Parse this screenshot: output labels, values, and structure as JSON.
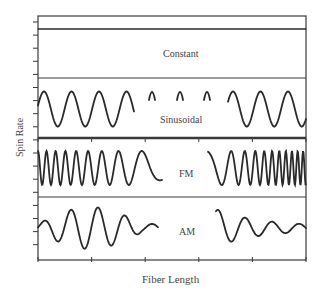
{
  "chart_data": {
    "type": "line",
    "title": "",
    "xlabel": "Fiber Length",
    "ylabel": "Spin Rate",
    "grid": false,
    "legend": null,
    "panels": [
      {
        "name": "Constant",
        "description": "flat horizontal line (constant spin rate)"
      },
      {
        "name": "Sinusoidal",
        "description": "sine wave with constant frequency and amplitude (middle section broken)"
      },
      {
        "name": "FM",
        "description": "frequency-modulated sine: frequency decreasing then increasing (chirp)"
      },
      {
        "name": "AM",
        "description": "amplitude-modulated sine: amplitude grows then decays"
      }
    ],
    "x_ticks": 6,
    "y_ticks_per_panel": "unlabeled minor ticks",
    "tick_labels": []
  },
  "labels": {
    "ylabel": "Spin Rate",
    "xlabel": "Fiber Length",
    "constant": "Constant",
    "sinusoidal": "Sinusoidal",
    "fm": "FM",
    "am": "AM"
  },
  "style": {
    "line_color": "#2a2a2a",
    "frame_color": "#3a3a3a",
    "background": "#ffffff"
  }
}
